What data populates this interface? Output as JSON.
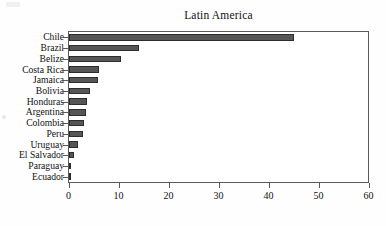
{
  "chart_data": {
    "type": "bar",
    "orientation": "horizontal",
    "title": "Latin America",
    "xlabel": "",
    "ylabel": "",
    "xlim": [
      0,
      60
    ],
    "xticks": [
      0,
      10,
      20,
      30,
      40,
      50,
      60
    ],
    "xticklabels": [
      "0",
      "10",
      "20",
      "30",
      "40",
      "50",
      "60"
    ],
    "grid": false,
    "legend": false,
    "categories": [
      "Chile",
      "Brazil",
      "Belize",
      "Costa Rica",
      "Jamaica",
      "Bolivia",
      "Honduras",
      "Argentina",
      "Colombia",
      "Peru",
      "Uruguay",
      "El Salvador",
      "Paraguay",
      "Ecuador"
    ],
    "values": [
      45,
      14,
      10.4,
      6,
      5.8,
      4.2,
      3.6,
      3.4,
      2.9,
      2.8,
      1.7,
      1,
      0.4,
      0.25
    ],
    "bar_color": "#565656",
    "bar_edge_color": "#2d2d2d",
    "axis_color": "#5a5a5a",
    "background_color": "#ffffff"
  }
}
